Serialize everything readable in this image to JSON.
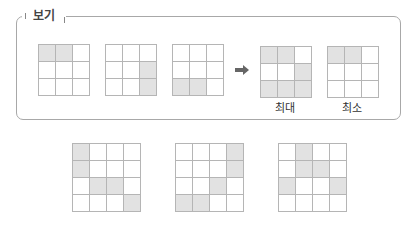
{
  "example_box": {
    "title": "보기",
    "grids": [
      {
        "name": "example-grid-1",
        "size": 3,
        "shaded": [
          [
            0,
            0
          ],
          [
            0,
            1
          ]
        ]
      },
      {
        "name": "example-grid-2",
        "size": 3,
        "shaded": [
          [
            1,
            2
          ],
          [
            2,
            2
          ]
        ]
      },
      {
        "name": "example-grid-3",
        "size": 3,
        "shaded": [
          [
            2,
            0
          ],
          [
            2,
            1
          ]
        ]
      }
    ],
    "arrow": "➡",
    "results": [
      {
        "label": "최대",
        "size": 3,
        "shaded": [
          [
            0,
            0
          ],
          [
            0,
            1
          ],
          [
            1,
            2
          ],
          [
            2,
            0
          ],
          [
            2,
            1
          ],
          [
            2,
            2
          ]
        ]
      },
      {
        "label": "최소",
        "size": 3,
        "shaded": [
          [
            0,
            0
          ],
          [
            0,
            1
          ]
        ]
      }
    ]
  },
  "problem_grids": [
    {
      "name": "problem-grid-1",
      "size": 4,
      "shaded": [
        [
          0,
          0
        ],
        [
          1,
          0
        ],
        [
          2,
          1
        ],
        [
          2,
          2
        ],
        [
          3,
          3
        ]
      ]
    },
    {
      "name": "problem-grid-2",
      "size": 4,
      "shaded": [
        [
          0,
          3
        ],
        [
          1,
          3
        ],
        [
          2,
          2
        ],
        [
          3,
          0
        ],
        [
          3,
          1
        ]
      ]
    },
    {
      "name": "problem-grid-3",
      "size": 4,
      "shaded": [
        [
          0,
          1
        ],
        [
          1,
          1
        ],
        [
          1,
          2
        ],
        [
          2,
          0
        ],
        [
          2,
          3
        ]
      ]
    }
  ],
  "colors": {
    "shaded": "#e2e2e2",
    "border": "#b5b5b5",
    "arrow": "#666666"
  }
}
